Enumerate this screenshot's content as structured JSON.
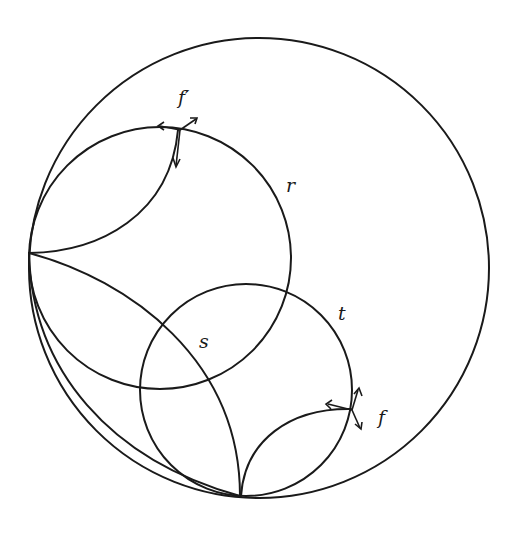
{
  "diagram": {
    "labels": {
      "f_prime": "f′",
      "r": "r",
      "s": "s",
      "t": "t",
      "f": "f"
    },
    "colors": {
      "background": "#ffffff",
      "ink": "#1a1a1a"
    },
    "shapes": {
      "outer_circle": {
        "cx": 259,
        "cy": 268,
        "r": 230
      },
      "circle_r": {
        "cx": 160,
        "cy": 258,
        "r": 131
      },
      "circle_t": {
        "cx": 246,
        "cy": 390,
        "r": 106
      }
    }
  }
}
